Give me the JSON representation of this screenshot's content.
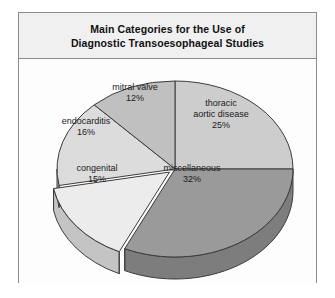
{
  "figure": {
    "title_line_1": "Main Categories for the Use of",
    "title_line_2": "Diagnostic Transoesophageal Studies"
  },
  "chart_data": {
    "type": "pie",
    "title": "Main Categories for the Use of Diagnostic Transoesophageal Studies",
    "xlabel": "",
    "ylabel": "",
    "unit": "%",
    "legend": "none",
    "grid": false,
    "three_d": true,
    "start_angle_deg": 0,
    "direction": "clockwise",
    "categories": [
      "thoracic aortic disease",
      "miscellaneous",
      "congenital",
      "endocarditis",
      "mitral valve"
    ],
    "values": [
      25,
      32,
      15,
      16,
      12
    ],
    "slices": [
      {
        "label_line_1": "thoracic",
        "label_line_2": "aortic disease",
        "value_label": "25%",
        "value": 25,
        "color": "#cdcdcd",
        "side_color": "#a8a8a8",
        "exploded": false
      },
      {
        "label_line_1": "miscellaneous",
        "label_line_2": "",
        "value_label": "32%",
        "value": 32,
        "color": "#9a9a9a",
        "side_color": "#7d7d7d",
        "exploded": false
      },
      {
        "label_line_1": "congenital",
        "label_line_2": "",
        "value_label": "15%",
        "value": 15,
        "color": "#ececec",
        "side_color": "#c4c4c4",
        "exploded": true
      },
      {
        "label_line_1": "endocarditis",
        "label_line_2": "",
        "value_label": "16%",
        "value": 16,
        "color": "#dcdcdc",
        "side_color": "#b5b5b5",
        "exploded": false
      },
      {
        "label_line_1": "mitral valve",
        "label_line_2": "",
        "value_label": "12%",
        "value": 12,
        "color": "#c0c0c0",
        "side_color": "#9d9d9d",
        "exploded": false
      }
    ]
  },
  "colors": {
    "frame_border": "#8c8c8c",
    "title_band_background": "#f0f0f0",
    "chart_background": "#fdfdfd",
    "page_background": "#ffffff",
    "outline": "#3c3c3c",
    "text": "#111111"
  }
}
